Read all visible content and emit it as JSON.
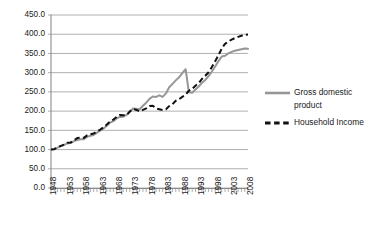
{
  "chart_data": {
    "type": "line",
    "title": "",
    "xlabel": "",
    "ylabel": "",
    "ylim": [
      0,
      450
    ],
    "ytick_step": 50,
    "ytick_labels": [
      "0.0",
      "50.0",
      "100.0",
      "150.0",
      "200.0",
      "250.0",
      "300.0",
      "350.0",
      "400.0",
      "450.0"
    ],
    "xlim": [
      1948,
      2008
    ],
    "xtick_labels": [
      "1948",
      "1953",
      "1958",
      "1963",
      "1968",
      "1973",
      "1978",
      "1983",
      "1988",
      "1993",
      "1998",
      "2003",
      "2008"
    ],
    "xtick_step": 5,
    "minor_xticks": "every year 1948-2008",
    "grid": "horizontal",
    "legend_position": "right",
    "colors": {
      "gross_domestic_product": "#969696",
      "household_income": "#111111",
      "gridline": "#8c8c8c",
      "background": "#ffffff",
      "text": "#1a1a1a"
    },
    "x": [
      1948,
      1949,
      1950,
      1951,
      1952,
      1953,
      1954,
      1955,
      1956,
      1957,
      1958,
      1959,
      1960,
      1961,
      1962,
      1963,
      1964,
      1965,
      1966,
      1967,
      1968,
      1969,
      1970,
      1971,
      1972,
      1973,
      1974,
      1975,
      1976,
      1977,
      1978,
      1979,
      1980,
      1981,
      1982,
      1983,
      1984,
      1985,
      1986,
      1987,
      1988,
      1989,
      1990,
      1991,
      1992,
      1993,
      1994,
      1995,
      1996,
      1997,
      1998,
      1999,
      2000,
      2001,
      2002,
      2003,
      2004,
      2005,
      2006,
      2007,
      2008
    ],
    "series": [
      {
        "name": "Gross domestic product",
        "style": "solid",
        "color": "#969696",
        "values": [
          100.0,
          101.5,
          105.0,
          109.0,
          112.0,
          116.0,
          117.0,
          122.0,
          125.0,
          127.0,
          127.0,
          133.0,
          136.0,
          138.0,
          144.0,
          149.0,
          155.0,
          162.0,
          170.0,
          174.0,
          181.0,
          185.0,
          185.5,
          190.0,
          198.0,
          207.0,
          206.0,
          205.0,
          214.0,
          222.0,
          232.0,
          238.0,
          237.0,
          241.0,
          237.0,
          246.0,
          262.0,
          271.0,
          280.0,
          288.0,
          299.0,
          309.0,
          249.0,
          248.0,
          256.0,
          264.0,
          274.0,
          281.0,
          291.0,
          303.0,
          316.0,
          330.0,
          342.0,
          344.0,
          350.0,
          354.0,
          357.0,
          359.0,
          361.0,
          363.0,
          362.0
        ]
      },
      {
        "name": "Household Income",
        "style": "dashed",
        "color": "#111111",
        "values": [
          100.0,
          101.0,
          106.0,
          109.5,
          113.0,
          118.0,
          118.5,
          124.0,
          130.0,
          131.0,
          130.5,
          137.0,
          140.0,
          142.0,
          147.0,
          152.0,
          158.0,
          165.0,
          173.0,
          178.0,
          185.0,
          190.0,
          189.0,
          189.5,
          199.0,
          206.0,
          203.0,
          199.0,
          203.0,
          207.0,
          213.0,
          214.0,
          207.0,
          205.0,
          203.0,
          205.0,
          213.0,
          218.0,
          227.0,
          231.0,
          237.0,
          243.0,
          253.0,
          258.0,
          266.0,
          273.0,
          284.0,
          292.0,
          301.0,
          315.0,
          330.0,
          345.0,
          363.0,
          375.0,
          381.0,
          386.0,
          390.0,
          393.0,
          396.0,
          398.0,
          399.0
        ]
      }
    ]
  },
  "legend": {
    "items": [
      {
        "label_line1": "Gross domestic",
        "label_line2": "product",
        "swatch": "solid-gray-line-icon"
      },
      {
        "label_line1": "Household Income",
        "label_line2": "",
        "swatch": "dashed-black-line-icon"
      }
    ]
  }
}
